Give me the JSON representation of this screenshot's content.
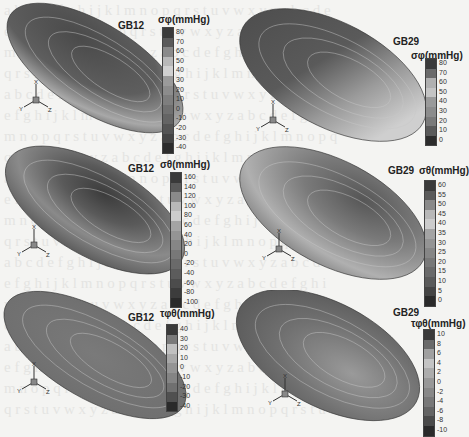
{
  "figure": {
    "background_show_through_text": true,
    "panels": [
      {
        "id": "a",
        "title": "GB12",
        "variable": "σφ(mmHg)",
        "legend_ticks": [
          "80",
          "70",
          "60",
          "50",
          "40",
          "30",
          "20",
          "10",
          "0",
          "-10",
          "-20",
          "-30",
          "-40"
        ],
        "legend_shades": [
          "#3a3a3a",
          "#5a5a5a",
          "#8a8a8a",
          "#b8b8b8",
          "#d0d0d0",
          "#9a9a9a",
          "#8c8c8c",
          "#7e7e7e",
          "#707070",
          "#646464",
          "#545454",
          "#444444",
          "#2c2c2c"
        ],
        "axes": {
          "x": "X",
          "y": "Y",
          "z": "Z"
        }
      },
      {
        "id": "b",
        "title": "GB29",
        "variable": "σφ(mmHg)",
        "legend_ticks": [
          "80",
          "70",
          "60",
          "50",
          "40",
          "30",
          "20",
          "10",
          "0"
        ],
        "legend_shades": [
          "#3a3a3a",
          "#6a6a6a",
          "#b0b0b0",
          "#c4c4c4",
          "#9a9a9a",
          "#8c8c8c",
          "#7a7a7a",
          "#5a5a5a",
          "#2c2c2c"
        ],
        "axes": {
          "x": "X",
          "y": "Y",
          "z": "Z"
        }
      },
      {
        "id": "c",
        "title": "GB12",
        "variable": "σθ(mmHg)",
        "legend_ticks": [
          "160",
          "140",
          "120",
          "100",
          "80",
          "60",
          "40",
          "20",
          "0",
          "-20",
          "-40",
          "-60",
          "-80",
          "-100"
        ],
        "legend_shades": [
          "#3a3a3a",
          "#5a5a5a",
          "#8a8a8a",
          "#b8b8b8",
          "#cccccc",
          "#a4a4a4",
          "#949494",
          "#868686",
          "#787878",
          "#6a6a6a",
          "#5c5c5c",
          "#4c4c4c",
          "#3c3c3c",
          "#2a2a2a"
        ],
        "axes": {
          "x": "X",
          "y": "Y",
          "z": "Z"
        }
      },
      {
        "id": "d",
        "title": "GB29",
        "variable": "σθ(mmHg)",
        "legend_ticks": [
          "60",
          "55",
          "50",
          "45",
          "40",
          "35",
          "30",
          "25",
          "20",
          "15",
          "10",
          "5",
          "0"
        ],
        "legend_shades": [
          "#3a3a3a",
          "#5a5a5a",
          "#8a8a8a",
          "#b8b8b8",
          "#cccccc",
          "#a4a4a4",
          "#949494",
          "#868686",
          "#787878",
          "#6a6a6a",
          "#5a5a5a",
          "#444444",
          "#2a2a2a"
        ],
        "axes": {
          "x": "X",
          "y": "Y",
          "z": "Z"
        }
      },
      {
        "id": "e",
        "title": "GB12",
        "variable": "τφθ(mmHg)",
        "legend_ticks": [
          "40",
          "30",
          "20",
          "10",
          "0",
          "-10",
          "-20",
          "-30",
          "-40"
        ],
        "legend_shades": [
          "#3a3a3a",
          "#7a7a7a",
          "#c0c0c0",
          "#a8a8a8",
          "#949494",
          "#848484",
          "#707070",
          "#505050",
          "#2a2a2a"
        ],
        "axes": {
          "x": "X",
          "y": "Y",
          "z": "Z"
        }
      },
      {
        "id": "f",
        "title": "GB29",
        "variable": "τφθ(mmHg)",
        "legend_ticks": [
          "10",
          "8",
          "6",
          "4",
          "2",
          "0",
          "-2",
          "-4",
          "-6",
          "-8",
          "-10"
        ],
        "legend_shades": [
          "#3a3a3a",
          "#6a6a6a",
          "#a0a0a0",
          "#c4c4c4",
          "#acacac",
          "#989898",
          "#888888",
          "#787878",
          "#646464",
          "#4a4a4a",
          "#2a2a2a"
        ],
        "axes": {
          "x": "X",
          "y": "Y",
          "z": "Z"
        }
      }
    ]
  }
}
